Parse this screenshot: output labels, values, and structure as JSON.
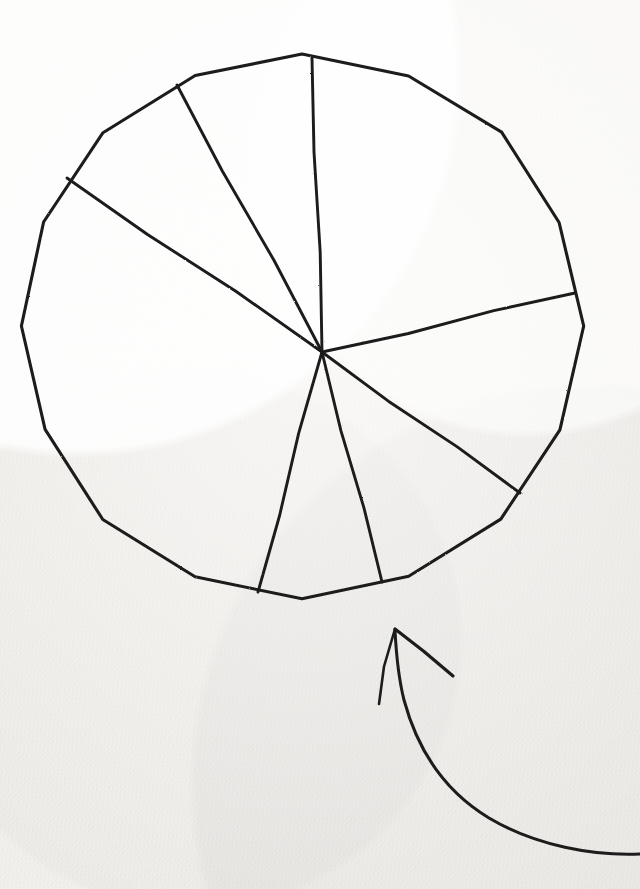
{
  "medium": {
    "surface": "paper",
    "paper_color": "#f3f1ed",
    "ink_color": "#1b1b1b",
    "style": "hand-drawn pen sketch",
    "canvas_width": 640,
    "canvas_height": 889
  },
  "chart_data": {
    "type": "pie",
    "title": "",
    "subtitle": "",
    "xlabel": "",
    "ylabel": "",
    "grid": false,
    "legend": null,
    "legend_position": "none",
    "labels_shown": false,
    "values_shown": false,
    "categories": [
      "slice-1",
      "slice-2",
      "slice-3",
      "slice-4",
      "slice-5",
      "slice-6",
      "slice-7"
    ],
    "start_angles_deg": [
      92,
      118,
      146,
      255,
      284,
      325,
      13
    ],
    "end_angles_deg": [
      118,
      146,
      255,
      284,
      325,
      13,
      92
    ],
    "sweep_angles_deg": [
      26,
      28,
      109,
      29,
      41,
      48,
      79
    ],
    "values": [
      26,
      28,
      109,
      29,
      41,
      48,
      79
    ],
    "percentages": [
      7.2,
      7.8,
      30.3,
      8.1,
      11.4,
      13.3,
      21.9
    ],
    "total": 360,
    "angle_units": "degrees",
    "angle_convention": "counterclockwise from east (3 o'clock)",
    "center": {
      "x": 322,
      "y": 352
    },
    "circle_outline": {
      "center_x": 302,
      "center_y": 326,
      "radius_x": 280,
      "radius_y": 272,
      "bounds": {
        "left": 22,
        "top": 54,
        "right": 582,
        "bottom": 598
      }
    },
    "spoke_endpoints": [
      {
        "name": "spoke-up",
        "x": 312,
        "y": 58,
        "angle_deg": 92,
        "reaches_rim": true
      },
      {
        "name": "spoke-upper-left",
        "x": 177,
        "y": 85,
        "angle_deg": 118,
        "reaches_rim": true
      },
      {
        "name": "spoke-left",
        "x": 67,
        "y": 178,
        "angle_deg": 146,
        "reaches_rim": true
      },
      {
        "name": "spoke-lower-left",
        "x": 258,
        "y": 592,
        "angle_deg": 255,
        "reaches_rim": true
      },
      {
        "name": "spoke-down",
        "x": 382,
        "y": 582,
        "angle_deg": 284,
        "reaches_rim": false
      },
      {
        "name": "spoke-lower-right",
        "x": 520,
        "y": 493,
        "angle_deg": 325,
        "reaches_rim": false
      },
      {
        "name": "spoke-right",
        "x": 575,
        "y": 293,
        "angle_deg": 13,
        "reaches_rim": true
      }
    ],
    "slice_count": 7
  },
  "annotation": {
    "arrow": {
      "shape": "curved arrow with open V arrowhead",
      "points_to": "pie chart",
      "direction": "up-left",
      "tip": {
        "x": 395,
        "y": 629
      },
      "barb_left_end": {
        "x": 379,
        "y": 704
      },
      "barb_right_end": {
        "x": 453,
        "y": 676
      },
      "tail_end": {
        "x": 640,
        "y": 854
      },
      "label": ""
    }
  },
  "text_content": {
    "any_text_present": false,
    "strings": []
  }
}
